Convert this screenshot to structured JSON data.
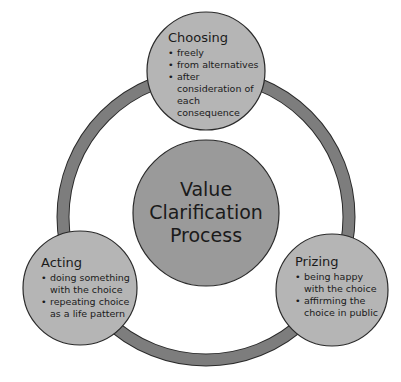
{
  "diagram": {
    "center": {
      "lines": [
        "Value",
        "Clarification",
        "Process"
      ]
    },
    "nodes": [
      {
        "id": "choosing",
        "title": "Choosing",
        "bullets": [
          "freely",
          "from alternatives",
          "after consideration of each consequence"
        ]
      },
      {
        "id": "prizing",
        "title": "Prizing",
        "bullets": [
          "being happy with the choice",
          "affirming the choice in public"
        ]
      },
      {
        "id": "acting",
        "title": "Acting",
        "bullets": [
          "doing something with the choice",
          "repeating choice as a life pattern"
        ]
      }
    ],
    "colors": {
      "ring": "#7d7d7d",
      "outline": "#2a2a2a",
      "center_fill": "#9a9a9a",
      "node_fill": "#b5b5b5"
    }
  }
}
